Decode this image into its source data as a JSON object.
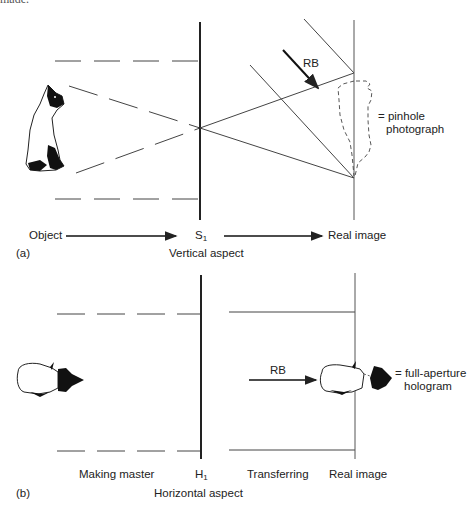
{
  "header_fragment": "made.",
  "panel_a": {
    "tag": "(a)",
    "object_label": "Object",
    "slit_label": "S",
    "slit_sub": "1",
    "aspect_label": "Vertical aspect",
    "real_image_label": "Real image",
    "rb_label": "RB",
    "note_line1": "= pinhole",
    "note_line2": "photograph"
  },
  "panel_b": {
    "tag": "(b)",
    "making_master_label": "Making master",
    "hologram_label": "H",
    "hologram_sub": "1",
    "aspect_label": "Horizontal aspect",
    "transferring_label": "Transferring",
    "real_image_label": "Real image",
    "rb_label": "RB",
    "note_line1": "= full-aperture",
    "note_line2": "hologram"
  },
  "colors": {
    "ink": "#222222",
    "line": "#444444"
  }
}
